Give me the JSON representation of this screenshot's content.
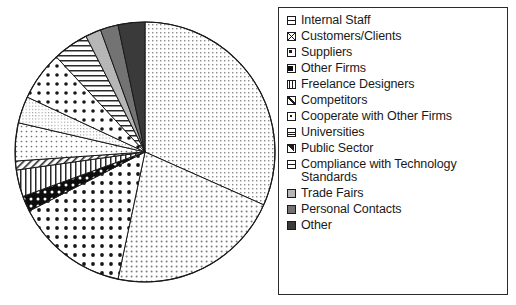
{
  "chart_data": {
    "type": "pie",
    "title": "",
    "subtitle": "",
    "xlabel": "",
    "ylabel": "",
    "grid": false,
    "legend_position": "right",
    "start_angle_deg": 0,
    "direction": "clockwise",
    "categories": [
      "Internal Staff",
      "Customers/Clients",
      "Suppliers",
      "Other Firms",
      "Freelance Designers",
      "Competitors",
      "Cooperate with Other Firms",
      "Universities",
      "Public Sector",
      "Compliance with Technology Standards",
      "Trade Fairs",
      "Personal Contacts",
      "Other"
    ],
    "values": [
      31.7,
      21.7,
      14.2,
      1.9,
      3.3,
      1.1,
      4.7,
      3.3,
      6.1,
      4.4,
      1.9,
      2.2,
      3.5
    ],
    "units": "percent",
    "slices": [
      {
        "label": "Internal Staff",
        "value": 31.7,
        "start_deg": 0.0,
        "end_deg": 114.0,
        "pattern": "fine-grid-dots",
        "color": "#f2f2f2"
      },
      {
        "label": "Customers/Clients",
        "value": 21.7,
        "start_deg": 114.0,
        "end_deg": 192.0,
        "pattern": "medium-dots",
        "color": "#ededed"
      },
      {
        "label": "Suppliers",
        "value": 14.2,
        "start_deg": 192.0,
        "end_deg": 243.0,
        "pattern": "large-dots",
        "color": "#ffffff"
      },
      {
        "label": "Other Firms",
        "value": 1.9,
        "start_deg": 243.0,
        "end_deg": 250.0,
        "pattern": "black-dots",
        "color": "#111111"
      },
      {
        "label": "Freelance Designers",
        "value": 3.3,
        "start_deg": 250.0,
        "end_deg": 262.0,
        "pattern": "vertical-lines",
        "color": "#ffffff"
      },
      {
        "label": "Competitors",
        "value": 1.1,
        "start_deg": 262.0,
        "end_deg": 266.0,
        "pattern": "diagonal-hatch",
        "color": "#ffffff"
      },
      {
        "label": "Cooperate with Other Firms",
        "value": 4.7,
        "start_deg": 266.0,
        "end_deg": 283.0,
        "pattern": "fine-dots",
        "color": "#fafafa"
      },
      {
        "label": "Universities",
        "value": 3.3,
        "start_deg": 283.0,
        "end_deg": 295.0,
        "pattern": "fine-grid",
        "color": "#f6f6f6"
      },
      {
        "label": "Public Sector",
        "value": 6.1,
        "start_deg": 295.0,
        "end_deg": 317.0,
        "pattern": "large-dots-2",
        "color": "#ffffff"
      },
      {
        "label": "Compliance with Technology Standards",
        "value": 4.4,
        "start_deg": 317.0,
        "end_deg": 333.0,
        "pattern": "horizontal-lines",
        "color": "#ffffff"
      },
      {
        "label": "Trade Fairs",
        "value": 1.9,
        "start_deg": 333.0,
        "end_deg": 340.0,
        "pattern": "solid",
        "color": "#b6b6b6"
      },
      {
        "label": "Personal Contacts",
        "value": 2.2,
        "start_deg": 340.0,
        "end_deg": 348.0,
        "pattern": "solid",
        "color": "#737373"
      },
      {
        "label": "Other",
        "value": 3.5,
        "start_deg": 348.0,
        "end_deg": 360.0,
        "pattern": "solid",
        "color": "#3a3a3a"
      }
    ],
    "geometry": {
      "cx": 145,
      "cy": 152,
      "r": 130
    }
  },
  "legend": {
    "items": [
      {
        "label": "Internal Staff",
        "swatch": "fine-grid-dots-swatch"
      },
      {
        "label": "Customers/Clients",
        "swatch": "crossed-box-swatch"
      },
      {
        "label": "Suppliers",
        "swatch": "corner-dot-swatch"
      },
      {
        "label": "Other Firms",
        "swatch": "black-square-swatch"
      },
      {
        "label": "Freelance Designers",
        "swatch": "vertical-lines-swatch"
      },
      {
        "label": "Competitors",
        "swatch": "diagonal-hatch-swatch"
      },
      {
        "label": "Cooperate with Other Firms",
        "swatch": "small-dot-swatch"
      },
      {
        "label": "Universities",
        "swatch": "fine-grid-swatch"
      },
      {
        "label": "Public Sector",
        "swatch": "half-dot-swatch"
      },
      {
        "label": "Compliance with Technology\nStandards",
        "swatch": "horizontal-lines-swatch"
      },
      {
        "label": "Trade Fairs",
        "swatch": "light-gray-swatch"
      },
      {
        "label": "Personal Contacts",
        "swatch": "medium-gray-swatch"
      },
      {
        "label": "Other",
        "swatch": "dark-gray-swatch"
      }
    ]
  },
  "colors": {
    "outline": "#1a1a1a",
    "text": "#1a1a1a",
    "background": "#ffffff",
    "trade_fairs": "#b6b6b6",
    "personal_contacts": "#737373",
    "other": "#3a3a3a"
  }
}
